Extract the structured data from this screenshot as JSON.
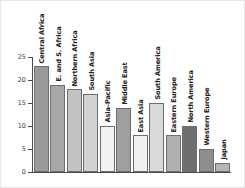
{
  "chart_data": {
    "type": "bar",
    "title": "",
    "subtitle": "",
    "xlabel": "",
    "ylabel": "",
    "ylim": [
      0,
      25
    ],
    "yticks": [
      0,
      5,
      10,
      15,
      20,
      25
    ],
    "ytick_labels": [
      "0",
      "5",
      "10",
      "15",
      "20",
      "25"
    ],
    "grid": false,
    "legend": "none",
    "orientation": "vertical",
    "label_rotation": "vertical",
    "categories": [
      "Central Africa",
      "E. and S. Africa",
      "Northern Africa",
      "South Asia",
      "Asia–Pacific",
      "Middle East",
      "East Asia",
      "South America",
      "Eastern Europe",
      "North America",
      "Western Europe",
      "Japan"
    ],
    "values": [
      23,
      19,
      18,
      17,
      10,
      14,
      8,
      15,
      8,
      10,
      5,
      2
    ],
    "bar_colors": [
      "#9a9a9a",
      "#a8a8a8",
      "#c2c2c2",
      "#d2d2d2",
      "#f2f2f2",
      "#9f9f9f",
      "#efefef",
      "#d9d9d9",
      "#b0b0b0",
      "#6f6f6f",
      "#8d8d8d",
      "#b5b5b5"
    ],
    "bar_edge_color": "#6e6e6e",
    "axis_color": "#4a4a4a",
    "background": "#ffffff",
    "frame_color": "#e6e6e6"
  }
}
